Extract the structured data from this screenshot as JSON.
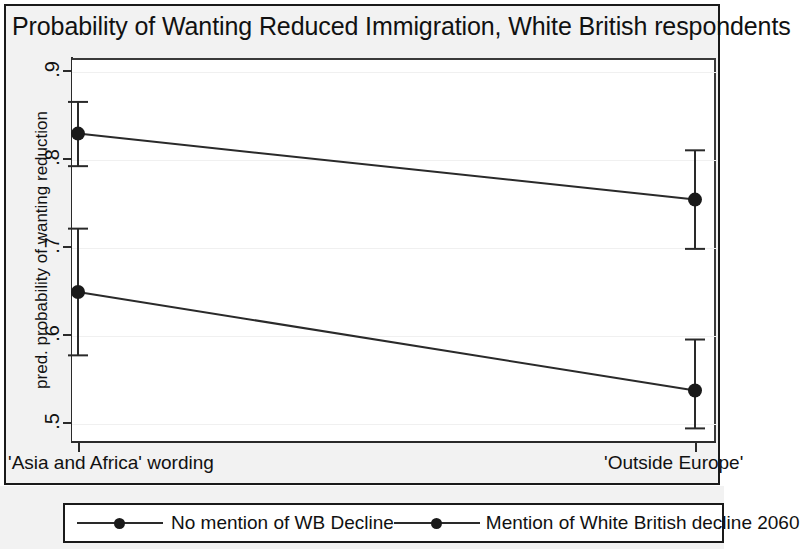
{
  "chart_data": {
    "type": "line",
    "title": "Probability of Wanting Reduced Immigration, White British respondents",
    "xlabel": "",
    "ylabel": "pred. probability of wanting reduction",
    "categories": [
      "'Asia and Africa' wording",
      "'Outside Europe'"
    ],
    "ylim": [
      0.46,
      0.93
    ],
    "yticks": [
      0.9,
      0.8,
      0.7,
      0.6,
      0.5
    ],
    "ytick_labels": [
      ".9",
      ".8",
      ".7",
      ".6",
      ".5"
    ],
    "grid": true,
    "legend_position": "bottom",
    "series": [
      {
        "name": "No mention of WB Decline",
        "values": [
          0.83,
          0.755
        ],
        "ci_low": [
          0.793,
          0.699
        ],
        "ci_high": [
          0.866,
          0.811
        ],
        "marker": "circle",
        "color": "#1a1a1a"
      },
      {
        "name": "Mention of White British decline 2060",
        "values": [
          0.65,
          0.538
        ],
        "ci_low": [
          0.578,
          0.495
        ],
        "ci_high": [
          0.722,
          0.596
        ],
        "marker": "circle",
        "color": "#1a1a1a"
      }
    ]
  },
  "title": "Probability of Wanting Reduced Immigration, White British respondents",
  "axes": {
    "y_axis_title": "pred. probability of wanting reduction",
    "y_tick_labels": [
      ".9",
      ".8",
      ".7",
      ".6",
      ".5"
    ],
    "x_tick_labels": [
      "'Asia and Africa' wording",
      "'Outside Europe'"
    ]
  },
  "legend": {
    "entries": [
      {
        "label": "No mention of WB Decline"
      },
      {
        "label": "Mention of White British decline 2060"
      }
    ]
  },
  "colors": {
    "line": "#2a2a2a",
    "marker": "#1a1a1a",
    "frame": "#1a1a1a",
    "background": "#f2f2f2",
    "plot_background": "#ffffff",
    "gridline": "#f0f0f0"
  }
}
